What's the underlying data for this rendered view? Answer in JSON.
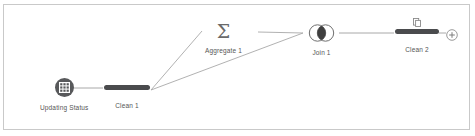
{
  "canvas": {
    "title": "Data Prep Flow Canvas",
    "background_color": "#ffffff",
    "border_color": "#c9c9c9"
  },
  "theme": {
    "node_dark": "#4a4b4d",
    "source_circle": "#58595b",
    "edge_color": "#9a9a9a",
    "label_color": "#555555",
    "glyph_color": "#6a6a6a"
  },
  "nodes": [
    {
      "id": "updating-status",
      "label": "Updating Status",
      "icon": "table-grid-icon",
      "type": "input-source"
    },
    {
      "id": "clean-1",
      "label": "Clean 1",
      "icon": "clean-step-bar-icon",
      "type": "clean-step"
    },
    {
      "id": "aggregate-1",
      "label": "Aggregate 1",
      "icon": "sigma-icon",
      "glyph": "Σ",
      "type": "aggregate-step"
    },
    {
      "id": "join-1",
      "label": "Join 1",
      "icon": "venn-join-icon",
      "type": "join-step"
    },
    {
      "id": "clean-2",
      "label": "Clean 2",
      "icon": "clean-step-bar-icon",
      "badge_icon": "document-page-icon",
      "type": "clean-step"
    }
  ],
  "actions": {
    "add_step": {
      "label": "+",
      "icon": "plus-circle-icon"
    }
  },
  "edges": [
    {
      "from": "updating-status",
      "to": "clean-1"
    },
    {
      "from": "clean-1",
      "to": "aggregate-1"
    },
    {
      "from": "clean-1",
      "to": "join-1"
    },
    {
      "from": "aggregate-1",
      "to": "join-1"
    },
    {
      "from": "join-1",
      "to": "clean-2"
    },
    {
      "from": "clean-2",
      "to": "add-step"
    }
  ]
}
